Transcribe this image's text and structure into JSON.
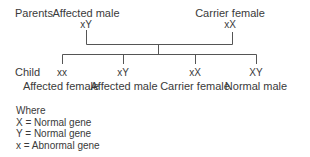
{
  "parents": {
    "row_label": "Parents",
    "father": {
      "label": "Affected male",
      "genotype": "xY"
    },
    "mother": {
      "label": "Carrier female",
      "genotype": "xX"
    }
  },
  "children": {
    "row_label": "Child",
    "items": [
      {
        "genotype": "xx",
        "label": "Affected female"
      },
      {
        "genotype": "xY",
        "label": "Affected male"
      },
      {
        "genotype": "xX",
        "label": "Carrier female"
      },
      {
        "genotype": "XY",
        "label": "Normal male"
      }
    ]
  },
  "legend": {
    "heading": "Where",
    "items": [
      "X = Normal gene",
      "Y = Normal gene",
      "x = Abnormal gene"
    ]
  },
  "colors": {
    "text": "#3a3a3a",
    "line": "#555555",
    "background": "#ffffff"
  }
}
